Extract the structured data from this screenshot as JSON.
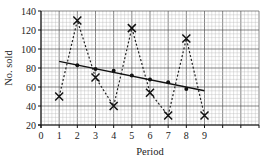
{
  "chart_data": {
    "type": "line",
    "title": "",
    "xlabel": "Period",
    "ylabel": "No. sold",
    "xlim": [
      0,
      12
    ],
    "ylim": [
      20,
      140
    ],
    "x_ticks": [
      0,
      1,
      2,
      3,
      4,
      5,
      6,
      7,
      8,
      9
    ],
    "y_ticks": [
      20,
      40,
      60,
      80,
      100,
      120,
      140
    ],
    "grid": true,
    "legend": null,
    "series": [
      {
        "name": "No. sold",
        "style": "dashed line with cross markers",
        "x": [
          1,
          2,
          3,
          4,
          5,
          6,
          7,
          8,
          9
        ],
        "values": [
          50,
          130,
          70,
          40,
          122,
          54,
          30,
          111,
          30
        ]
      },
      {
        "name": "Moving average",
        "style": "dot markers",
        "x": [
          2,
          3,
          4,
          5,
          6,
          7,
          8
        ],
        "values": [
          83,
          79,
          77,
          72,
          68,
          65,
          58
        ]
      },
      {
        "name": "Trend line",
        "style": "solid line",
        "x": [
          1,
          9
        ],
        "values": [
          87,
          56
        ]
      }
    ]
  },
  "colors": {
    "grid_minor": "#b8b8b8",
    "grid_major": "#555555",
    "data": "#222222"
  }
}
